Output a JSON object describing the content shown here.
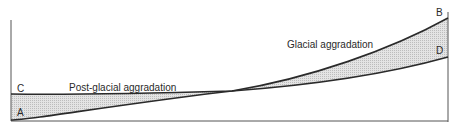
{
  "diagram": {
    "labels": {
      "point_a": "A",
      "point_b": "B",
      "point_c": "C",
      "point_d": "D",
      "post_glacial": "Post-glacial aggradation",
      "glacial": "Glacial aggradation"
    },
    "colors": {
      "line": "#2a2a2a",
      "fill": "#d9d9d9",
      "background": "#ffffff"
    }
  }
}
